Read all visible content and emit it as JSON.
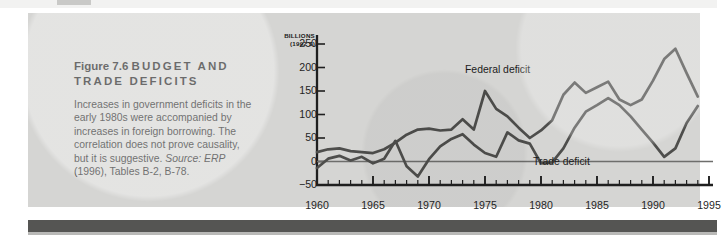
{
  "figure": {
    "number": "Figure 7.6",
    "title": "BUDGET AND TRADE DEFICITS",
    "title_line1": "BUDGET AND",
    "title_line2": "TRADE DEFICITS",
    "caption": "Increases in government deficits in the early 1980s were accompanied by increases in foreign borrowing. The correlation does not prove causality, but it is suggestive.",
    "source_label": "Source:",
    "source_text": "ERP (1996), Tables B-2, B-78.",
    "source_publication": "ERP",
    "source_rest": "(1996), Tables B-2, B-78."
  },
  "colors": {
    "panel_background": "#d5d5d3",
    "page_background": "#ffffff",
    "bottom_rule": "#555553",
    "line_series": "#4e4e4c",
    "axis": "#1f1f1f",
    "zero_line": "#6e6e6c",
    "text": "#1b1b1b"
  },
  "chart_data": {
    "type": "line",
    "title": "BUDGET AND TRADE DEFICITS",
    "unit_label_line1": "BILLIONS",
    "unit_label_line2": "(1992 $)",
    "xlabel": "",
    "ylabel": "BILLIONS (1992 $)",
    "xlim": [
      1960,
      1995
    ],
    "ylim": [
      -50,
      250
    ],
    "yticks": [
      250,
      200,
      150,
      100,
      50,
      0,
      -50
    ],
    "ytick_labels": [
      "250",
      "200",
      "150",
      "100",
      "50",
      "0",
      "−50"
    ],
    "xticks": [
      1960,
      1965,
      1970,
      1975,
      1980,
      1985,
      1990,
      1995
    ],
    "xtick_labels": [
      "1960",
      "1965",
      "1970",
      "1975",
      "1980",
      "1985",
      "1990",
      "1995"
    ],
    "minor_xtick_interval": 1,
    "grid": false,
    "zero_line": true,
    "legend": "inline-annotations",
    "annotations": [
      {
        "text": "Federal deficit",
        "x": 1981.5,
        "y": 208
      },
      {
        "text": "Trade deficit",
        "x": 1987.0,
        "y": 46
      }
    ],
    "x": [
      1960,
      1961,
      1962,
      1963,
      1964,
      1965,
      1966,
      1967,
      1968,
      1969,
      1970,
      1971,
      1972,
      1973,
      1974,
      1975,
      1976,
      1977,
      1978,
      1979,
      1980,
      1981,
      1982,
      1983,
      1984,
      1985,
      1986,
      1987,
      1988,
      1989,
      1990,
      1991,
      1992,
      1993,
      1994
    ],
    "series": [
      {
        "name": "Federal deficit",
        "values": [
          20,
          26,
          28,
          22,
          20,
          18,
          26,
          40,
          57,
          68,
          70,
          66,
          68,
          90,
          68,
          150,
          112,
          96,
          72,
          50,
          66,
          88,
          142,
          168,
          146,
          158,
          170,
          132,
          120,
          132,
          172,
          218,
          240,
          188,
          138
        ]
      },
      {
        "name": "Trade deficit",
        "values": [
          -14,
          6,
          12,
          2,
          10,
          -4,
          6,
          44,
          -10,
          -32,
          5,
          32,
          48,
          58,
          36,
          18,
          10,
          62,
          45,
          38,
          -4,
          -2,
          28,
          72,
          106,
          120,
          135,
          120,
          96,
          68,
          40,
          10,
          28,
          82,
          118
        ]
      }
    ]
  }
}
